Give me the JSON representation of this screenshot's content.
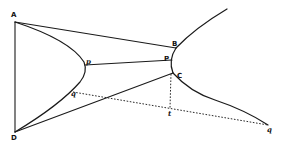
{
  "diagram": {
    "type": "geometric-figure",
    "colors": {
      "ink": "#1a1a1a",
      "background": "#ffffff"
    },
    "points": {
      "A": {
        "label": "A",
        "x": 15,
        "y": 22
      },
      "B": {
        "label": "B",
        "x": 176,
        "y": 48
      },
      "P": {
        "label": "P",
        "x": 172,
        "y": 60
      },
      "C": {
        "label": "C",
        "x": 173,
        "y": 73
      },
      "p": {
        "label": "p",
        "x": 85,
        "y": 65
      },
      "q_left": {
        "label": "q",
        "x": 73,
        "y": 92
      },
      "D": {
        "label": "D",
        "x": 15,
        "y": 132
      },
      "t": {
        "label": "t",
        "x": 170,
        "y": 108
      },
      "q_right": {
        "label": "q",
        "x": 268,
        "y": 125
      }
    },
    "labels": {
      "A": "A",
      "B": "B",
      "P": "P",
      "C": "C",
      "p": "p",
      "q_left": "q",
      "D": "D",
      "t": "t",
      "q_right": "q"
    }
  }
}
